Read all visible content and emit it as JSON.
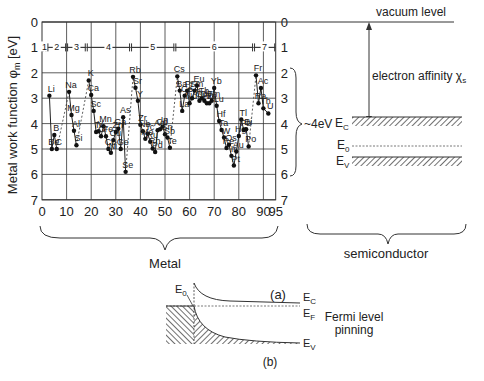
{
  "panel_a": {
    "label": "(a)",
    "ylabel": "Metal work function φm [eV]",
    "ylabel_main": "Metal work function φ",
    "ylabel_sub": "m",
    "ylabel_unit": " [eV]",
    "yticks": [
      "0",
      "1",
      "2",
      "3",
      "4",
      "5",
      "6",
      "7"
    ],
    "xticks": [
      "0",
      "10",
      "20",
      "30",
      "40",
      "50",
      "60",
      "70",
      "80",
      "90",
      "95"
    ],
    "periods": [
      "1",
      "2",
      "3",
      "4",
      "5",
      "6",
      "7"
    ],
    "metal_label": "Metal",
    "range_label": "~4eV",
    "semiconductor_label": "semiconductor",
    "vacuum_level": "vacuum level",
    "electron_affinity": "electron affinity χ",
    "electron_affinity_sub": "s",
    "ec": "E",
    "ec_sub": "C",
    "e0": "E",
    "e0_sub": "0",
    "ev": "E",
    "ev_sub": "V"
  },
  "panel_b": {
    "label": "(b)",
    "e0": "E",
    "e0_sub": "0",
    "ec": "E",
    "ec_sub": "C",
    "ef": "E",
    "ef_sub": "F",
    "ev": "E",
    "ev_sub": "V",
    "pinning_line1": "Fermi level",
    "pinning_line2": "pinning"
  },
  "chart_data": {
    "type": "scatter",
    "title": "",
    "xlabel": "Atomic number",
    "ylabel": "Metal work function φm [eV]",
    "xlim": [
      0,
      95
    ],
    "ylim": [
      7,
      0
    ],
    "grid": true,
    "points": [
      {
        "el": "Li",
        "z": 3,
        "phi": 2.9
      },
      {
        "el": "Be",
        "z": 4,
        "phi": 5.0
      },
      {
        "el": "B",
        "z": 5,
        "phi": 4.45
      },
      {
        "el": "C",
        "z": 6,
        "phi": 5.0
      },
      {
        "el": "Na",
        "z": 11,
        "phi": 2.75
      },
      {
        "el": "Mg",
        "z": 12,
        "phi": 3.66
      },
      {
        "el": "Al",
        "z": 13,
        "phi": 4.28
      },
      {
        "el": "Si",
        "z": 14,
        "phi": 4.85
      },
      {
        "el": "K",
        "z": 19,
        "phi": 2.3
      },
      {
        "el": "Ca",
        "z": 20,
        "phi": 2.87
      },
      {
        "el": "Sc",
        "z": 21,
        "phi": 3.5
      },
      {
        "el": "Ti",
        "z": 22,
        "phi": 4.33
      },
      {
        "el": "V",
        "z": 23,
        "phi": 4.3
      },
      {
        "el": "Cr",
        "z": 24,
        "phi": 4.5
      },
      {
        "el": "Mn",
        "z": 25,
        "phi": 4.1
      },
      {
        "el": "Fe",
        "z": 26,
        "phi": 4.5
      },
      {
        "el": "Co",
        "z": 27,
        "phi": 5.0
      },
      {
        "el": "Ni",
        "z": 28,
        "phi": 5.15
      },
      {
        "el": "Cu",
        "z": 29,
        "phi": 4.65
      },
      {
        "el": "Zn",
        "z": 30,
        "phi": 4.33
      },
      {
        "el": "Ga",
        "z": 31,
        "phi": 4.2
      },
      {
        "el": "Ge",
        "z": 32,
        "phi": 5.0
      },
      {
        "el": "As",
        "z": 33,
        "phi": 3.75
      },
      {
        "el": "Se",
        "z": 34,
        "phi": 5.9
      },
      {
        "el": "Rb",
        "z": 37,
        "phi": 2.16
      },
      {
        "el": "Sr",
        "z": 38,
        "phi": 2.59
      },
      {
        "el": "Y",
        "z": 39,
        "phi": 3.1
      },
      {
        "el": "Zr",
        "z": 40,
        "phi": 4.05
      },
      {
        "el": "Nb",
        "z": 41,
        "phi": 4.3
      },
      {
        "el": "Mo",
        "z": 42,
        "phi": 4.6
      },
      {
        "el": "Tc",
        "z": 43,
        "phi": 4.4
      },
      {
        "el": "Ru",
        "z": 44,
        "phi": 4.71
      },
      {
        "el": "Rh",
        "z": 45,
        "phi": 4.98
      },
      {
        "el": "Pd",
        "z": 46,
        "phi": 5.12
      },
      {
        "el": "Ag",
        "z": 47,
        "phi": 4.26
      },
      {
        "el": "Cd",
        "z": 48,
        "phi": 4.22
      },
      {
        "el": "In",
        "z": 49,
        "phi": 4.12
      },
      {
        "el": "Sn",
        "z": 50,
        "phi": 4.42
      },
      {
        "el": "Sb",
        "z": 51,
        "phi": 4.55
      },
      {
        "el": "Te",
        "z": 52,
        "phi": 4.95
      },
      {
        "el": "Cs",
        "z": 55,
        "phi": 2.14
      },
      {
        "el": "Ba",
        "z": 56,
        "phi": 2.7
      },
      {
        "el": "La",
        "z": 57,
        "phi": 3.5
      },
      {
        "el": "Ce",
        "z": 58,
        "phi": 2.9
      },
      {
        "el": "Pr",
        "z": 59,
        "phi": 2.7
      },
      {
        "el": "Nd",
        "z": 60,
        "phi": 3.2
      },
      {
        "el": "Pm",
        "z": 61,
        "phi": 3.0
      },
      {
        "el": "Sm",
        "z": 62,
        "phi": 2.7
      },
      {
        "el": "Eu",
        "z": 63,
        "phi": 2.5
      },
      {
        "el": "Gd",
        "z": 64,
        "phi": 3.1
      },
      {
        "el": "Tb",
        "z": 65,
        "phi": 3.0
      },
      {
        "el": "Dy",
        "z": 66,
        "phi": 3.1
      },
      {
        "el": "Ho",
        "z": 67,
        "phi": 3.2
      },
      {
        "el": "Er",
        "z": 68,
        "phi": 3.2
      },
      {
        "el": "Tm",
        "z": 69,
        "phi": 3.1
      },
      {
        "el": "Yb",
        "z": 70,
        "phi": 2.6
      },
      {
        "el": "Lu",
        "z": 71,
        "phi": 3.3
      },
      {
        "el": "Hf",
        "z": 72,
        "phi": 3.9
      },
      {
        "el": "Ta",
        "z": 73,
        "phi": 4.25
      },
      {
        "el": "W",
        "z": 74,
        "phi": 4.55
      },
      {
        "el": "Re",
        "z": 75,
        "phi": 4.96
      },
      {
        "el": "Os",
        "z": 76,
        "phi": 4.83
      },
      {
        "el": "Ir",
        "z": 77,
        "phi": 5.27
      },
      {
        "el": "Pt",
        "z": 78,
        "phi": 5.65
      },
      {
        "el": "Au",
        "z": 79,
        "phi": 5.1
      },
      {
        "el": "Hg",
        "z": 80,
        "phi": 4.49
      },
      {
        "el": "Tl",
        "z": 81,
        "phi": 3.84
      },
      {
        "el": "Pb",
        "z": 82,
        "phi": 4.25
      },
      {
        "el": "Bi",
        "z": 83,
        "phi": 4.22
      },
      {
        "el": "Po",
        "z": 84,
        "phi": 4.9
      },
      {
        "el": "Fr",
        "z": 87,
        "phi": 2.1
      },
      {
        "el": "Ra",
        "z": 88,
        "phi": 3.2
      },
      {
        "el": "Ac",
        "z": 89,
        "phi": 2.6
      },
      {
        "el": "Th",
        "z": 90,
        "phi": 3.4
      },
      {
        "el": "U",
        "z": 92,
        "phi": 3.6
      }
    ],
    "period_spans": [
      {
        "label": "1",
        "from": 0,
        "to": 2
      },
      {
        "label": "2",
        "from": 2,
        "to": 10
      },
      {
        "label": "3",
        "from": 10,
        "to": 18
      },
      {
        "label": "4",
        "from": 18,
        "to": 36
      },
      {
        "label": "5",
        "from": 36,
        "to": 54
      },
      {
        "label": "6",
        "from": 54,
        "to": 86
      },
      {
        "label": "7",
        "from": 86,
        "to": 95
      }
    ],
    "annotations": [
      "vacuum level",
      "electron affinity χs",
      "~4eV",
      "EC",
      "E0",
      "EV",
      "Metal",
      "semiconductor",
      "(a)",
      "(b)",
      "Fermi level pinning"
    ]
  }
}
